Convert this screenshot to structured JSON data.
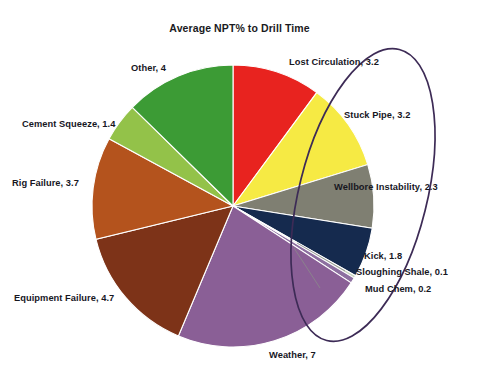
{
  "chart_data": {
    "type": "pie",
    "title": "Average NPT% to Drill Time",
    "xlabel": "",
    "ylabel": "",
    "legend_position": "none",
    "labels_show_value": true,
    "total": 31.6,
    "start_angle_deg": 0,
    "direction": "clockwise",
    "categories": [
      "Lost Circulation",
      "Stuck Pipe",
      "Wellbore Instability",
      "Kick",
      "Sloughing Shale",
      "Mud Chem",
      "Weather",
      "Equipment Failure",
      "Rig Failure",
      "Cement Squeeze",
      "Other"
    ],
    "values": [
      3.2,
      3.2,
      2.3,
      1.8,
      0.1,
      0.2,
      7,
      4.7,
      3.7,
      1.4,
      4
    ],
    "colors": [
      "#e8231f",
      "#f6ea44",
      "#7f7f72",
      "#152a4e",
      "#c9d5c0",
      "#8d6fa0",
      "#8a5f96",
      "#7d3318",
      "#b4531d",
      "#93c249",
      "#3c9b35"
    ],
    "slices": [
      {
        "label": "Lost Circulation, 3.2",
        "name": "Lost Circulation",
        "value": 3.2,
        "color": "#e8231f"
      },
      {
        "label": "Stuck Pipe, 3.2",
        "name": "Stuck Pipe",
        "value": 3.2,
        "color": "#f6ea44"
      },
      {
        "label": "Wellbore Instability, 2.3",
        "name": "Wellbore Instability",
        "value": 2.3,
        "color": "#7f7f72"
      },
      {
        "label": "Kick, 1.8",
        "name": "Kick",
        "value": 1.8,
        "color": "#152a4e"
      },
      {
        "label": "Sloughing Shale, 0.1",
        "name": "Sloughing Shale",
        "value": 0.1,
        "color": "#c9d5c0"
      },
      {
        "label": "Mud Chem, 0.2",
        "name": "Mud Chem",
        "value": 0.2,
        "color": "#8d6fa0"
      },
      {
        "label": "Weather, 7",
        "name": "Weather",
        "value": 7,
        "color": "#8a5f96"
      },
      {
        "label": "Equipment Failure, 4.7",
        "name": "Equipment Failure",
        "value": 4.7,
        "color": "#7d3318"
      },
      {
        "label": "Rig Failure, 3.7",
        "name": "Rig Failure",
        "value": 3.7,
        "color": "#b4531d"
      },
      {
        "label": "Cement Squeeze, 1.4",
        "name": "Cement Squeeze",
        "value": 1.4,
        "color": "#93c249"
      },
      {
        "label": "Other, 4",
        "name": "Other",
        "value": 4,
        "color": "#3c9b35"
      }
    ],
    "annotations": [
      {
        "type": "ellipse",
        "name": "highlight-ellipse",
        "color": "#3d2b56"
      }
    ]
  },
  "labels": {
    "lost_circulation": "Lost Circulation, 3.2",
    "stuck_pipe": "Stuck Pipe, 3.2",
    "wellbore_instability": "Wellbore Instability, 2.3",
    "kick": "Kick, 1.8",
    "sloughing_shale": "Sloughing Shale, 0.1",
    "mud_chem": "Mud Chem, 0.2",
    "weather": "Weather, 7",
    "equipment_failure": "Equipment Failure, 4.7",
    "rig_failure": "Rig Failure, 3.7",
    "cement_squeeze": "Cement Squeeze, 1.4",
    "other": "Other, 4"
  }
}
